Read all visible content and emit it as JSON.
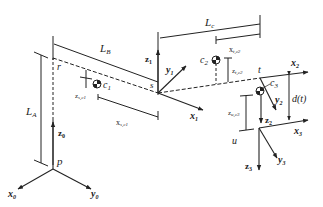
{
  "diagram": {
    "type": "robot-kinematics-schematic",
    "colors": {
      "line": "#222222",
      "background": "#ffffff"
    },
    "labels": {
      "LA": "L",
      "LA_sub": "A",
      "LB": "L",
      "LB_sub": "B",
      "LC": "L",
      "LC_sub": "c",
      "r": "r",
      "s": "s",
      "t": "t",
      "u": "u",
      "p": "p",
      "c1": "c",
      "c1_sub": "1",
      "c2": "c",
      "c2_sub": "2",
      "c3": "c",
      "c3_sub": "3",
      "z_sc1": "z",
      "z_sc1_sub": "s,c1",
      "x_sc1": "x",
      "x_sc1_sub": "s,c1",
      "x_tc2": "x",
      "x_tc2_sub": "t,c2",
      "z_tc2": "z",
      "z_tc2_sub": "t,c2",
      "z_uc3": "z",
      "z_uc3_sub": "u,c3",
      "d_t": "d(t)"
    },
    "axes": {
      "x0": "x",
      "x0_sub": "0",
      "y0": "y",
      "y0_sub": "0",
      "z0": "z",
      "z0_sub": "0",
      "x1": "x",
      "x1_sub": "1",
      "y1": "y",
      "y1_sub": "1",
      "z1": "z",
      "z1_sub": "1",
      "x2": "x",
      "x2_sub": "2",
      "y2": "y",
      "y2_sub": "2",
      "z2": "z",
      "z2_sub": "2",
      "x3": "x",
      "x3_sub": "3",
      "y3": "y",
      "y3_sub": "3",
      "z3": "z",
      "z3_sub": "3"
    }
  }
}
